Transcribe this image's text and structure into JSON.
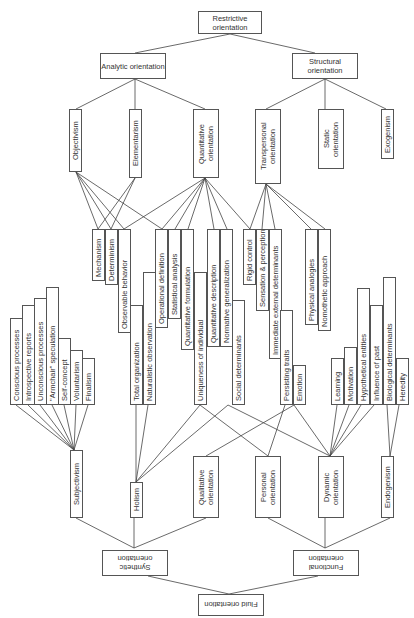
{
  "diagram": {
    "top": {
      "root": "Restrictive orientation",
      "level1": [
        "Analytic orientation",
        "Structural orientation"
      ],
      "level2": [
        "Objectivism",
        "Elementarism",
        "Quantitative orientation",
        "Transpersonal orientation",
        "Static orientation",
        "Exogenism"
      ]
    },
    "middle": {
      "attributes": [
        "Mechanism",
        "Determinism",
        "Observable behavior",
        "Operational definition",
        "Statistical analysis",
        "Quantitative formulation",
        "Quantitative description",
        "Normative generalization",
        "Rigid control",
        "Sensation & perception",
        "Immediate external determinants",
        "Physical analogies",
        "Nomothetic approach",
        "Conscious processes",
        "Introspective reports",
        "Unconscious processes",
        "\"Armchair\" speculation",
        "Self-concept",
        "Voluntarism",
        "Finalism",
        "Total organization",
        "Naturalistic observation",
        "Uniqueness of individual",
        "Social determinants",
        "Persisting traits",
        "Emotion",
        "Learning",
        "Motivation",
        "Hypothetical entities",
        "Influence of past",
        "Biological determinants",
        "Heredity"
      ]
    },
    "bottom": {
      "level2": [
        "Subjectivism",
        "Holism",
        "Qualitative orientation",
        "Personal orientation",
        "Dynamic orientation",
        "Endogenism"
      ],
      "level1": [
        "Synthetic orientation",
        "Functional orientation"
      ],
      "root": "Fluid orientation"
    }
  }
}
